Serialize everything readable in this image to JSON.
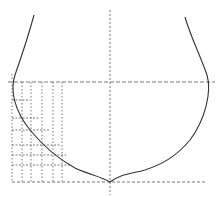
{
  "diagram": {
    "type": "hull-cross-section",
    "background": "#ffffff",
    "stroke_color": "#333333",
    "guide_color": "#555555",
    "hull_outline": {
      "left": "M34 15 C30 30, 22 55, 15 75 C10 90, 14 110, 30 130 C45 148, 60 160, 75 168 C90 175, 100 176, 110 182",
      "right": "M185 17 C190 35, 200 55, 207 75 C212 92, 205 120, 190 140 C175 158, 160 165, 145 170 C130 174, 118 175, 110 182"
    },
    "waterline_y": 82,
    "baseline_y": 182,
    "centerline_x": 110,
    "station_lines_x": [
      12,
      22,
      31,
      42,
      53,
      62
    ],
    "offset_lines": [
      {
        "y": 100,
        "x_end": 22
      },
      {
        "y": 118,
        "x_end": 31
      },
      {
        "y": 130,
        "x_end": 42
      },
      {
        "y": 145,
        "x_end": 53
      },
      {
        "y": 155,
        "x_end": 58
      },
      {
        "y": 165,
        "x_end": 62
      }
    ]
  }
}
